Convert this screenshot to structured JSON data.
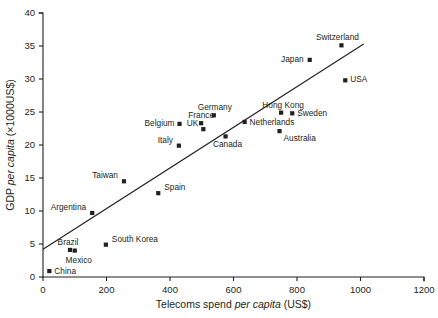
{
  "chart_data": {
    "type": "scatter",
    "title": "",
    "xlabel": "Telecoms spend per capita (US$)",
    "ylabel": "GDP per capita (×1000US$)",
    "xlabel_parts": {
      "pre": "Telecoms spend ",
      "italic": "per capita",
      "post": " (US$)"
    },
    "ylabel_parts": {
      "pre": "GDP ",
      "italic": "per capita",
      "post": " (×1000US$)"
    },
    "xlim": [
      0,
      1200
    ],
    "ylim": [
      0,
      40
    ],
    "xticks": [
      0,
      200,
      400,
      600,
      800,
      1000,
      1200
    ],
    "yticks": [
      0,
      5,
      10,
      15,
      20,
      25,
      30,
      35,
      40
    ],
    "xtick_labels": [
      "0",
      "200",
      "400",
      "600",
      "800",
      "1000",
      "1200"
    ],
    "ytick_labels": [
      "0",
      "5",
      "10",
      "15",
      "20",
      "25",
      "30",
      "35",
      "40"
    ],
    "grid": false,
    "legend": false,
    "legend_position": "none",
    "marker_shape": "square",
    "marker_color": "#231f20",
    "points": [
      {
        "label": "China",
        "x": 20,
        "y": 0.9,
        "label_dx": 5,
        "label_dy": 3,
        "anchor": "start"
      },
      {
        "label": "Brazil",
        "x": 85,
        "y": 4.1,
        "label_dx": -2,
        "label_dy": -5,
        "anchor": "middle"
      },
      {
        "label": "Mexico",
        "x": 100,
        "y": 4.0,
        "label_dx": 4,
        "label_dy": 12,
        "anchor": "middle"
      },
      {
        "label": "South Korea",
        "x": 198,
        "y": 4.9,
        "label_dx": 6,
        "label_dy": -3,
        "anchor": "start"
      },
      {
        "label": "Argentina",
        "x": 155,
        "y": 9.7,
        "label_dx": -6,
        "label_dy": -3,
        "anchor": "end"
      },
      {
        "label": "Spain",
        "x": 363,
        "y": 12.7,
        "label_dx": 6,
        "label_dy": -3,
        "anchor": "start"
      },
      {
        "label": "Taiwan",
        "x": 255,
        "y": 14.5,
        "label_dx": -6,
        "label_dy": -3,
        "anchor": "end"
      },
      {
        "label": "Italy",
        "x": 428,
        "y": 19.9,
        "label_dx": -6,
        "label_dy": -3,
        "anchor": "end"
      },
      {
        "label": "Canada",
        "x": 575,
        "y": 21.3,
        "label_dx": 2,
        "label_dy": 11,
        "anchor": "middle"
      },
      {
        "label": "Australia",
        "x": 745,
        "y": 22.1,
        "label_dx": 4,
        "label_dy": 10,
        "anchor": "start"
      },
      {
        "label": "UK",
        "x": 505,
        "y": 22.4,
        "label_dx": -5,
        "label_dy": -3,
        "anchor": "end"
      },
      {
        "label": "Belgium",
        "x": 430,
        "y": 23.2,
        "label_dx": -5,
        "label_dy": 2,
        "anchor": "end"
      },
      {
        "label": "France",
        "x": 498,
        "y": 23.3,
        "label_dx": 0,
        "label_dy": -5,
        "anchor": "middle"
      },
      {
        "label": "Netherlands",
        "x": 635,
        "y": 23.5,
        "label_dx": 5,
        "label_dy": 3,
        "anchor": "start"
      },
      {
        "label": "Germany",
        "x": 538,
        "y": 24.5,
        "label_dx": 1,
        "label_dy": -5,
        "anchor": "middle"
      },
      {
        "label": "Hong Kong",
        "x": 750,
        "y": 24.9,
        "label_dx": 2,
        "label_dy": -5,
        "anchor": "middle"
      },
      {
        "label": "Sweden",
        "x": 785,
        "y": 24.8,
        "label_dx": 5,
        "label_dy": 3,
        "anchor": "start"
      },
      {
        "label": "USA",
        "x": 952,
        "y": 29.8,
        "label_dx": 5,
        "label_dy": 2,
        "anchor": "start"
      },
      {
        "label": "Japan",
        "x": 840,
        "y": 32.9,
        "label_dx": -6,
        "label_dy": 2,
        "anchor": "end"
      },
      {
        "label": "Switzerland",
        "x": 940,
        "y": 35.1,
        "label_dx": -4,
        "label_dy": -5,
        "anchor": "middle"
      }
    ],
    "trend_line": {
      "name": "best-fit line",
      "x_start": 0,
      "y_start": 4.2,
      "x_end": 1010,
      "y_end": 35.3
    }
  }
}
